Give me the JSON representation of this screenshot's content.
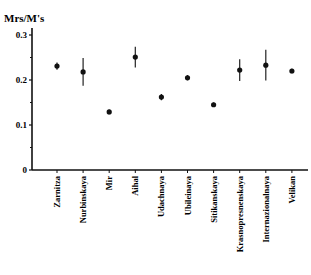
{
  "chart_data": {
    "type": "scatter",
    "title": "",
    "xlabel": "",
    "ylabel": "Mrs/M's",
    "ylim": [
      0,
      0.3
    ],
    "yticks": [
      "0",
      "0.1",
      "0.2",
      "0.3"
    ],
    "grid": false,
    "legend": null,
    "categories": [
      "Zarnitza",
      "Nurbinskaya",
      "Mir",
      "Aihal",
      "Udachnaya",
      "Ubileinaya",
      "Sitikanskaya",
      "Krasnopresnenskaya",
      "Internazionalnaya",
      "Velikan"
    ],
    "values": [
      0.231,
      0.218,
      0.129,
      0.251,
      0.162,
      0.205,
      0.145,
      0.222,
      0.233,
      0.22
    ],
    "errors": [
      0.008,
      0.031,
      0.005,
      0.023,
      0.007,
      0.006,
      0.005,
      0.024,
      0.034,
      0.005
    ]
  }
}
